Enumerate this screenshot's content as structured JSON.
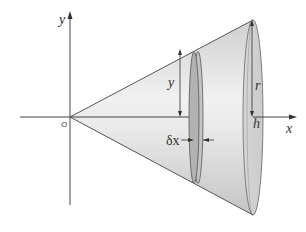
{
  "diagram": {
    "labels": {
      "y_axis": "y",
      "x_axis": "x",
      "origin": "O",
      "disk_radius": "y",
      "cone_radius": "r",
      "cone_height": "h",
      "disk_thickness": "δx"
    },
    "colors": {
      "axis": "#444444",
      "cone_fill_light": "#ececec",
      "cone_fill_dark": "#c9c9c9",
      "disk_fill": "#b4b4b4",
      "edge": "#555555"
    }
  }
}
